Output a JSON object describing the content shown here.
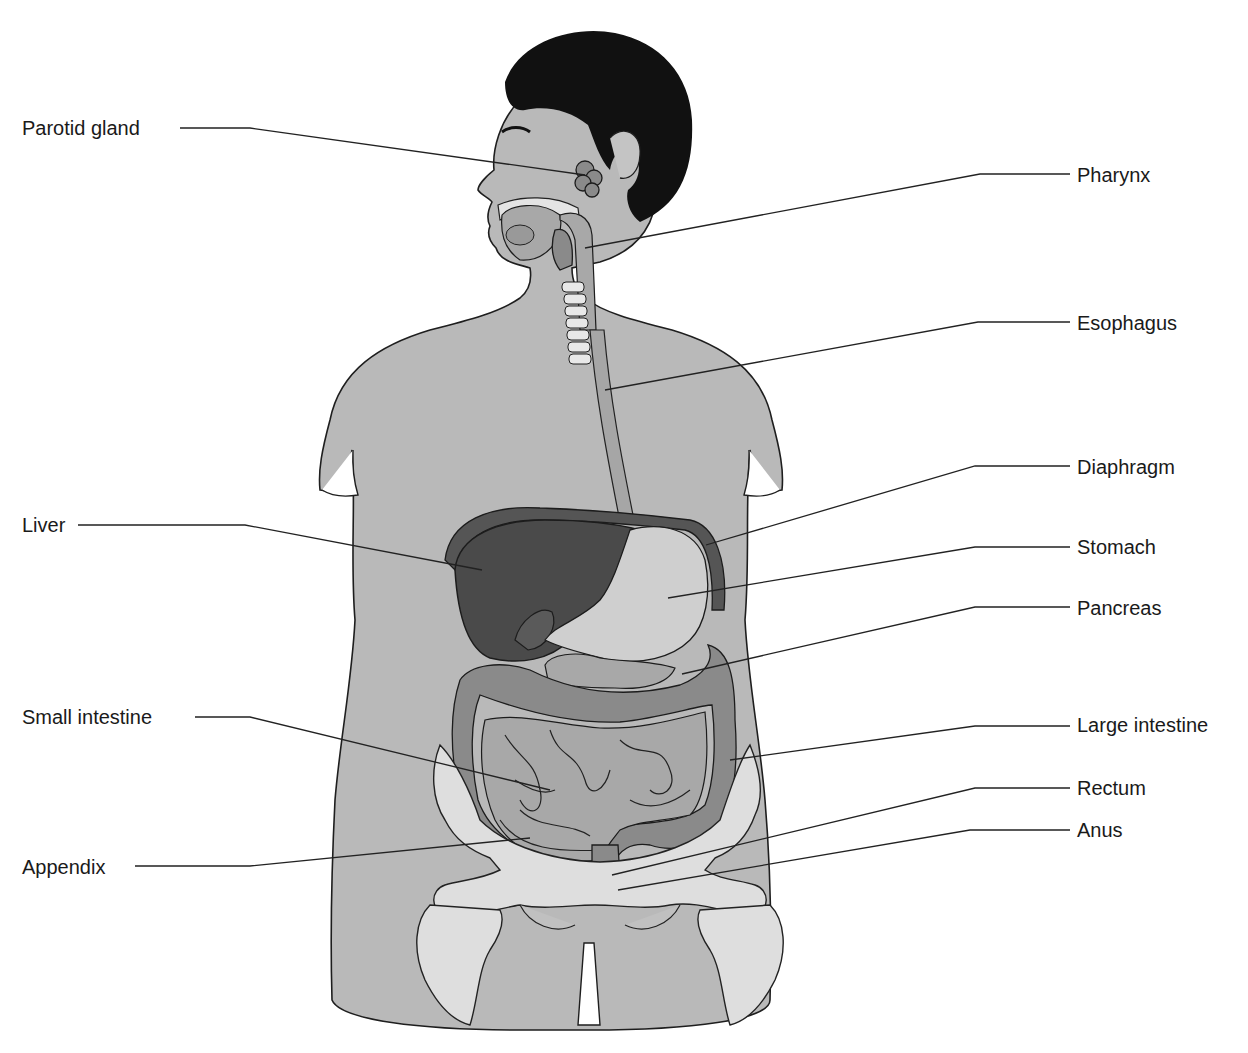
{
  "diagram": {
    "colors": {
      "skin": "#b9b9b9",
      "hair": "#111111",
      "liver": "#4a4a4a",
      "stomach": "#cfcfcf",
      "intestine": "#8a8a8a",
      "bone": "#dedede",
      "leader_line": "#222222",
      "label_text": "#1a1a1a"
    },
    "labels_left": [
      {
        "text": "Parotid gland",
        "x": 22,
        "y": 118
      },
      {
        "text": "Liver",
        "x": 22,
        "y": 515
      },
      {
        "text": "Small intestine",
        "x": 22,
        "y": 707
      },
      {
        "text": "Appendix",
        "x": 22,
        "y": 857
      }
    ],
    "labels_right": [
      {
        "text": "Pharynx",
        "x": 1077,
        "y": 165
      },
      {
        "text": "Esophagus",
        "x": 1077,
        "y": 313
      },
      {
        "text": "Diaphragm",
        "x": 1077,
        "y": 457
      },
      {
        "text": "Stomach",
        "x": 1077,
        "y": 537
      },
      {
        "text": "Pancreas",
        "x": 1077,
        "y": 598
      },
      {
        "text": "Large intestine",
        "x": 1077,
        "y": 715
      },
      {
        "text": "Rectum",
        "x": 1077,
        "y": 778
      },
      {
        "text": "Anus",
        "x": 1077,
        "y": 820
      }
    ]
  }
}
